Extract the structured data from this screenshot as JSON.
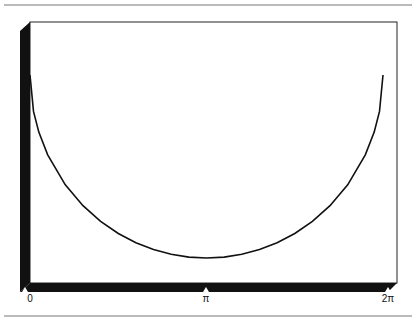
{
  "chart_data": {
    "type": "line",
    "title": "",
    "xlabel": "",
    "ylabel": "",
    "style": "3d-box",
    "xlim": [
      0,
      6.2832
    ],
    "ylim": [
      -1.2,
      0.3
    ],
    "grid": false,
    "legend": "none",
    "x_ticks": [
      {
        "value": 0,
        "label": "0"
      },
      {
        "value": 3.1416,
        "label": "π"
      },
      {
        "value": 6.2832,
        "label": "2π"
      }
    ],
    "series": [
      {
        "name": "curve",
        "color": "#111111",
        "x": [
          0,
          0.0628,
          0.1571,
          0.3142,
          0.6283,
          0.9425,
          1.2566,
          1.5708,
          1.885,
          2.1991,
          2.5133,
          2.8274,
          3.1416,
          3.4558,
          3.7699,
          4.0841,
          4.3982,
          4.7124,
          5.0265,
          5.3407,
          5.6549,
          5.969,
          6.1261,
          6.2204,
          6.2832
        ],
        "y": [
          0,
          -0.199,
          -0.312,
          -0.436,
          -0.6,
          -0.714,
          -0.8,
          -0.866,
          -0.917,
          -0.954,
          -0.98,
          -0.995,
          -1,
          -0.995,
          -0.98,
          -0.954,
          -0.917,
          -0.866,
          -0.8,
          -0.714,
          -0.6,
          -0.436,
          -0.312,
          -0.199,
          0
        ]
      }
    ]
  }
}
